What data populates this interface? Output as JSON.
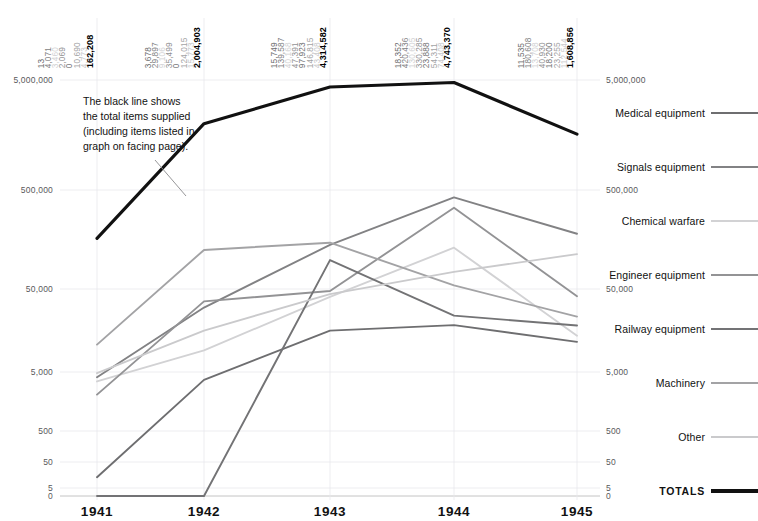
{
  "chart_data": {
    "type": "line",
    "title": "",
    "xlabel": "",
    "ylabel": "",
    "categories": [
      "1941",
      "1942",
      "1943",
      "1944",
      "1945"
    ],
    "yscale": "log",
    "yticks": [
      "0",
      "5",
      "50",
      "500",
      "5,000",
      "50,000",
      "500,000",
      "5,000,000"
    ],
    "ylim": [
      0,
      5000000
    ],
    "grid": true,
    "legend_position": "right",
    "annotation": "The black line shows the total items supplied (including items listed in graph on facing page).",
    "series": [
      {
        "name": "Medical equipment",
        "color": "#6e6e70",
        "values": [
          13,
          3678,
          15749,
          18352,
          11535
        ],
        "labels": [
          "13",
          "3,678",
          "15,749",
          "18,352",
          "11,535"
        ]
      },
      {
        "name": "Signals equipment",
        "color": "#828284",
        "values": [
          4071,
          29897,
          139587,
          420436,
          180608
        ],
        "labels": [
          "4,071",
          "29,897",
          "139,587",
          "420,436",
          "180,608"
        ]
      },
      {
        "name": "Chemical warfare",
        "color": "#d2d2d4",
        "values": [
          3460,
          9106,
          40168,
          130605,
          13708
        ],
        "labels": [
          "3,460",
          "9,106",
          "40,168",
          "130,605",
          "13,708"
        ]
      },
      {
        "name": "Engineer equipment",
        "color": "#939395",
        "values": [
          2069,
          35499,
          47391,
          330285,
          40930
        ],
        "labels": [
          "2,069",
          "35,499",
          "47,391",
          "330,285",
          "40,930"
        ]
      },
      {
        "name": "Railway equipment",
        "color": "#737375",
        "values": [
          0,
          0,
          97923,
          23888,
          18200
        ],
        "labels": [
          "0",
          "0",
          "97,923",
          "23,888",
          "18,200"
        ]
      },
      {
        "name": "Machinery",
        "color": "#a3a3a5",
        "values": [
          10690,
          124015,
          146815,
          54311,
          23255
        ],
        "labels": [
          "10,690",
          "124,015",
          "146,815",
          "54,311",
          "23,255"
        ]
      },
      {
        "name": "Other",
        "color": "#cacacc",
        "values": [
          4773,
          15773,
          43408,
          74408,
          112544
        ],
        "labels": [
          "4,773",
          "15,773",
          "43,408",
          "74,408",
          "112,544"
        ]
      },
      {
        "name": "TOTALS",
        "color": "#111111",
        "values": [
          162208,
          2004903,
          4314582,
          4743370,
          1608856
        ],
        "labels": [
          "162,208",
          "2,004,903",
          "4,314,582",
          "4,743,370",
          "1,608,856"
        ]
      }
    ]
  },
  "axis": {
    "y_labels": [
      "5,000,000",
      "500,000",
      "50,000",
      "5,000",
      "500",
      "50",
      "5",
      "0"
    ],
    "x_labels": [
      "1941",
      "1942",
      "1943",
      "1944",
      "1945"
    ]
  },
  "annotation": {
    "line1": "The black line shows",
    "line2": "the total items supplied",
    "line3": "(including items listed in",
    "line4": "graph on facing page)."
  },
  "legend": {
    "items": [
      {
        "label": "Medical equipment",
        "color": "#6e6e70"
      },
      {
        "label": "Signals equipment",
        "color": "#828284"
      },
      {
        "label": "Chemical warfare",
        "color": "#d2d2d4"
      },
      {
        "label": "Engineer equipment",
        "color": "#939395"
      },
      {
        "label": "Railway equipment",
        "color": "#737375"
      },
      {
        "label": "Machinery",
        "color": "#a3a3a5"
      },
      {
        "label": "Other",
        "color": "#cacacc"
      },
      {
        "label": "TOTALS",
        "color": "#111111"
      }
    ]
  }
}
